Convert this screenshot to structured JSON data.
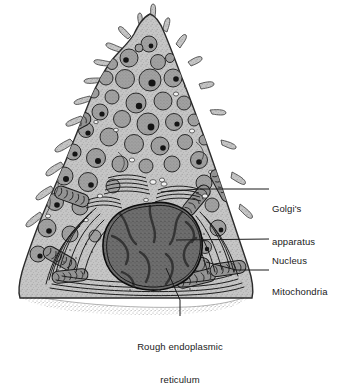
{
  "figure": {
    "type": "biological-illustration",
    "style": "grayscale stippled line drawing",
    "background_color": "#ffffff"
  },
  "labels": [
    {
      "id": "golgi",
      "text": "Golgi's\napparatus",
      "lines": [
        "Golgi's",
        "apparatus"
      ],
      "align": "left",
      "leader": true
    },
    {
      "id": "nucleus",
      "text": "Nucleus",
      "lines": [
        "Nucleus"
      ],
      "align": "left",
      "leader": true
    },
    {
      "id": "mito",
      "text": "Mitochondria",
      "lines": [
        "Mitochondria"
      ],
      "align": "left",
      "leader": true
    },
    {
      "id": "rer",
      "text": "Rough endoplasmic\nreticulum",
      "lines": [
        "Rough endoplasmic",
        "reticulum"
      ],
      "align": "center",
      "leader": true
    }
  ],
  "structures": [
    {
      "name": "microvilli",
      "location": "apex",
      "count": 18
    },
    {
      "name": "secretory-granules",
      "location": "apical-cytoplasm",
      "count": 46,
      "fill": "#9a9a9a",
      "core": "#1a1a1a"
    },
    {
      "name": "mitochondria",
      "location": "basal-lateral",
      "count": 9,
      "fill": "#8d8d8d"
    },
    {
      "name": "golgi-apparatus",
      "location": "supranuclear",
      "count": 3
    },
    {
      "name": "nucleus",
      "location": "basal",
      "count": 1,
      "fill": "#6b6b6b",
      "outline": "#111111"
    },
    {
      "name": "rough-endoplasmic-reticulum",
      "location": "basal-perinuclear",
      "count": 1
    },
    {
      "name": "basement-membrane",
      "location": "base",
      "count": 1,
      "fill": "#b5b5b5"
    },
    {
      "name": "plasma-membrane",
      "location": "perimeter",
      "count": 1,
      "outline": "#2a2a2a"
    }
  ],
  "colors": {
    "cytoplasm": "#c9c9c9",
    "granule": "#9a9a9a",
    "granule_core": "#151515",
    "nucleus": "#6b6b6b",
    "chromatin": "#3a3a3a",
    "membrane_line": "#222222",
    "basement_membrane": "#b9b9b9",
    "label_text": "#1a1a1a",
    "leader_line": "#1a1a1a",
    "background": "#ffffff"
  }
}
